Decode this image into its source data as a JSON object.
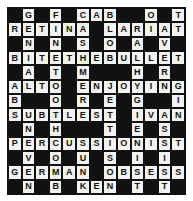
{
  "puzzle": {
    "type": "crossword",
    "title": "Crossword Puzzle Grid",
    "rows": 13,
    "columns": 13,
    "colors": {
      "block": "#111111",
      "fill": "#f2f2f0",
      "letter": "#111111",
      "page": "#ffffff"
    },
    "block_symbol": "#",
    "grid": [
      [
        "#",
        "G",
        "#",
        "F",
        "#",
        "C",
        "A",
        "B",
        "#",
        "#",
        "O",
        "#",
        "T"
      ],
      [
        "R",
        "E",
        "T",
        "I",
        "N",
        "A",
        "#",
        "L",
        "A",
        "R",
        "I",
        "A",
        "T"
      ],
      [
        "#",
        "N",
        "#",
        "N",
        "#",
        "S",
        "#",
        "O",
        "#",
        "A",
        "#",
        "V",
        "#"
      ],
      [
        "B",
        "I",
        "T",
        "E",
        "T",
        "H",
        "E",
        "B",
        "U",
        "L",
        "L",
        "E",
        "T"
      ],
      [
        "#",
        "A",
        "#",
        "T",
        "#",
        "M",
        "#",
        "#",
        "#",
        "H",
        "#",
        "R",
        "#"
      ],
      [
        "A",
        "L",
        "T",
        "O",
        "#",
        "E",
        "N",
        "J",
        "O",
        "Y",
        "I",
        "N",
        "G"
      ],
      [
        "B",
        "#",
        "#",
        "O",
        "#",
        "R",
        "#",
        "E",
        "#",
        "G",
        "#",
        "#",
        "I"
      ],
      [
        "S",
        "U",
        "B",
        "T",
        "L",
        "E",
        "S",
        "T",
        "#",
        "I",
        "V",
        "A",
        "N"
      ],
      [
        "#",
        "N",
        "#",
        "H",
        "#",
        "#",
        "#",
        "T",
        "#",
        "E",
        "#",
        "S",
        "#"
      ],
      [
        "P",
        "E",
        "R",
        "C",
        "U",
        "S",
        "S",
        "I",
        "O",
        "N",
        "I",
        "S",
        "T"
      ],
      [
        "#",
        "V",
        "#",
        "O",
        "#",
        "U",
        "#",
        "S",
        "#",
        "I",
        "#",
        "I",
        "#"
      ],
      [
        "G",
        "E",
        "R",
        "M",
        "A",
        "N",
        "#",
        "O",
        "B",
        "S",
        "E",
        "S",
        "S"
      ],
      [
        "#",
        "N",
        "#",
        "B",
        "#",
        "K",
        "E",
        "N",
        "#",
        "T",
        "#",
        "T",
        "#"
      ]
    ],
    "across_entries": [
      "CAB",
      "RETINA",
      "LARIAT",
      "BITETHEBULLET",
      "ALTO",
      "ENJOYING",
      "SUBTLEST",
      "IVAN",
      "PERCUSSIONIST",
      "GERMAN",
      "OBSESS",
      "KEN"
    ],
    "down_entries": [
      "GENIALUNEVEN",
      "FINETOOTHCOMB",
      "CASHMERESUNK",
      "ABOB",
      "ALHYGIENIST",
      "OILIVES",
      "TTTGINST"
    ]
  }
}
